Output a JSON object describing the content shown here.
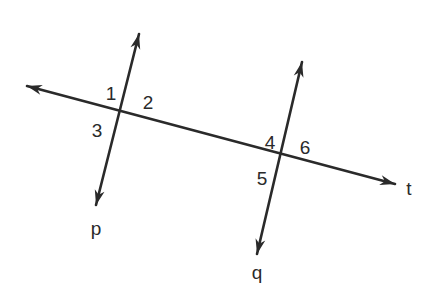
{
  "diagram": {
    "stroke_color": "#2a2a2a",
    "background": "#ffffff",
    "lines": [
      {
        "name": "t",
        "label": "t",
        "role": "transversal",
        "x1": 27,
        "y1": 86,
        "x2": 395,
        "y2": 184,
        "arrows": "both"
      },
      {
        "name": "p",
        "label": "p",
        "x1": 139,
        "y1": 34,
        "x2": 96,
        "y2": 205,
        "arrows": "both"
      },
      {
        "name": "q",
        "label": "q",
        "x1": 302,
        "y1": 62,
        "x2": 257,
        "y2": 254,
        "arrows": "both"
      }
    ],
    "intersections": [
      {
        "lines": [
          "p",
          "t"
        ],
        "x": 121,
        "y": 112
      },
      {
        "lines": [
          "q",
          "t"
        ],
        "x": 283,
        "y": 155
      }
    ],
    "angle_labels": [
      {
        "text": "1",
        "x": 111,
        "y": 93
      },
      {
        "text": "2",
        "x": 148,
        "y": 102
      },
      {
        "text": "3",
        "x": 97,
        "y": 130
      },
      {
        "text": "4",
        "x": 270,
        "y": 142
      },
      {
        "text": "6",
        "x": 305,
        "y": 147
      },
      {
        "text": "5",
        "x": 262,
        "y": 178
      }
    ],
    "line_labels": [
      {
        "text": "t",
        "x": 409,
        "y": 188
      },
      {
        "text": "p",
        "x": 96,
        "y": 228
      },
      {
        "text": "q",
        "x": 257,
        "y": 272
      }
    ]
  }
}
